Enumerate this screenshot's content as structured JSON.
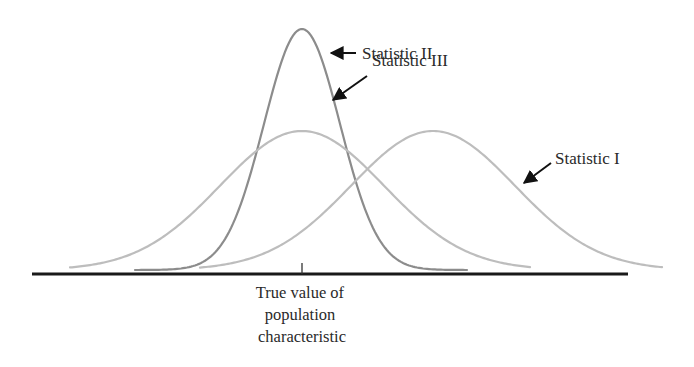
{
  "figure": {
    "type": "sampling-distributions-diagram",
    "baseline": {
      "x1": 32,
      "x2": 628,
      "y": 274,
      "color": "#1a1a1a",
      "width": 3
    },
    "tick": {
      "x": 302,
      "y1": 263,
      "y2": 274,
      "color": "#333333"
    },
    "axis_label_lines": [
      "True value of",
      "population",
      "characteristic"
    ],
    "curves": [
      {
        "id": "statistic-ii",
        "label": "Statistic II",
        "mean_x": 302,
        "peak_y": 29,
        "sigma": 38,
        "x_start": 135,
        "x_end": 467,
        "color": "#8c8c8c",
        "width": 2.2
      },
      {
        "id": "statistic-iii",
        "label": "Statistic III",
        "mean_x": 302,
        "peak_y": 131,
        "sigma": 82,
        "x_start": 70,
        "x_end": 530,
        "color": "#bdbdbd",
        "width": 2.2
      },
      {
        "id": "statistic-i",
        "label": "Statistic I",
        "mean_x": 433,
        "peak_y": 131,
        "sigma": 82,
        "x_start": 200,
        "x_end": 662,
        "color": "#bdbdbd",
        "width": 2.2
      }
    ],
    "curve_base_y": 270,
    "annotations": [
      {
        "curve": "statistic-ii",
        "text": "Statistic II",
        "text_x": 362,
        "text_y": 59,
        "arrow": {
          "x1": 356,
          "y1": 53,
          "x2": 331,
          "y2": 53
        }
      },
      {
        "curve": "statistic-iii",
        "text": "Statistic III",
        "text_x": 372,
        "text_y": 66,
        "arrow": {
          "x1": 367,
          "y1": 76,
          "x2": 333,
          "y2": 100
        }
      },
      {
        "curve": "statistic-i",
        "text": "Statistic I",
        "text_x": 555,
        "text_y": 164,
        "arrow": {
          "x1": 551,
          "y1": 163,
          "x2": 524,
          "y2": 183
        }
      }
    ],
    "arrow_color": "#111111"
  }
}
